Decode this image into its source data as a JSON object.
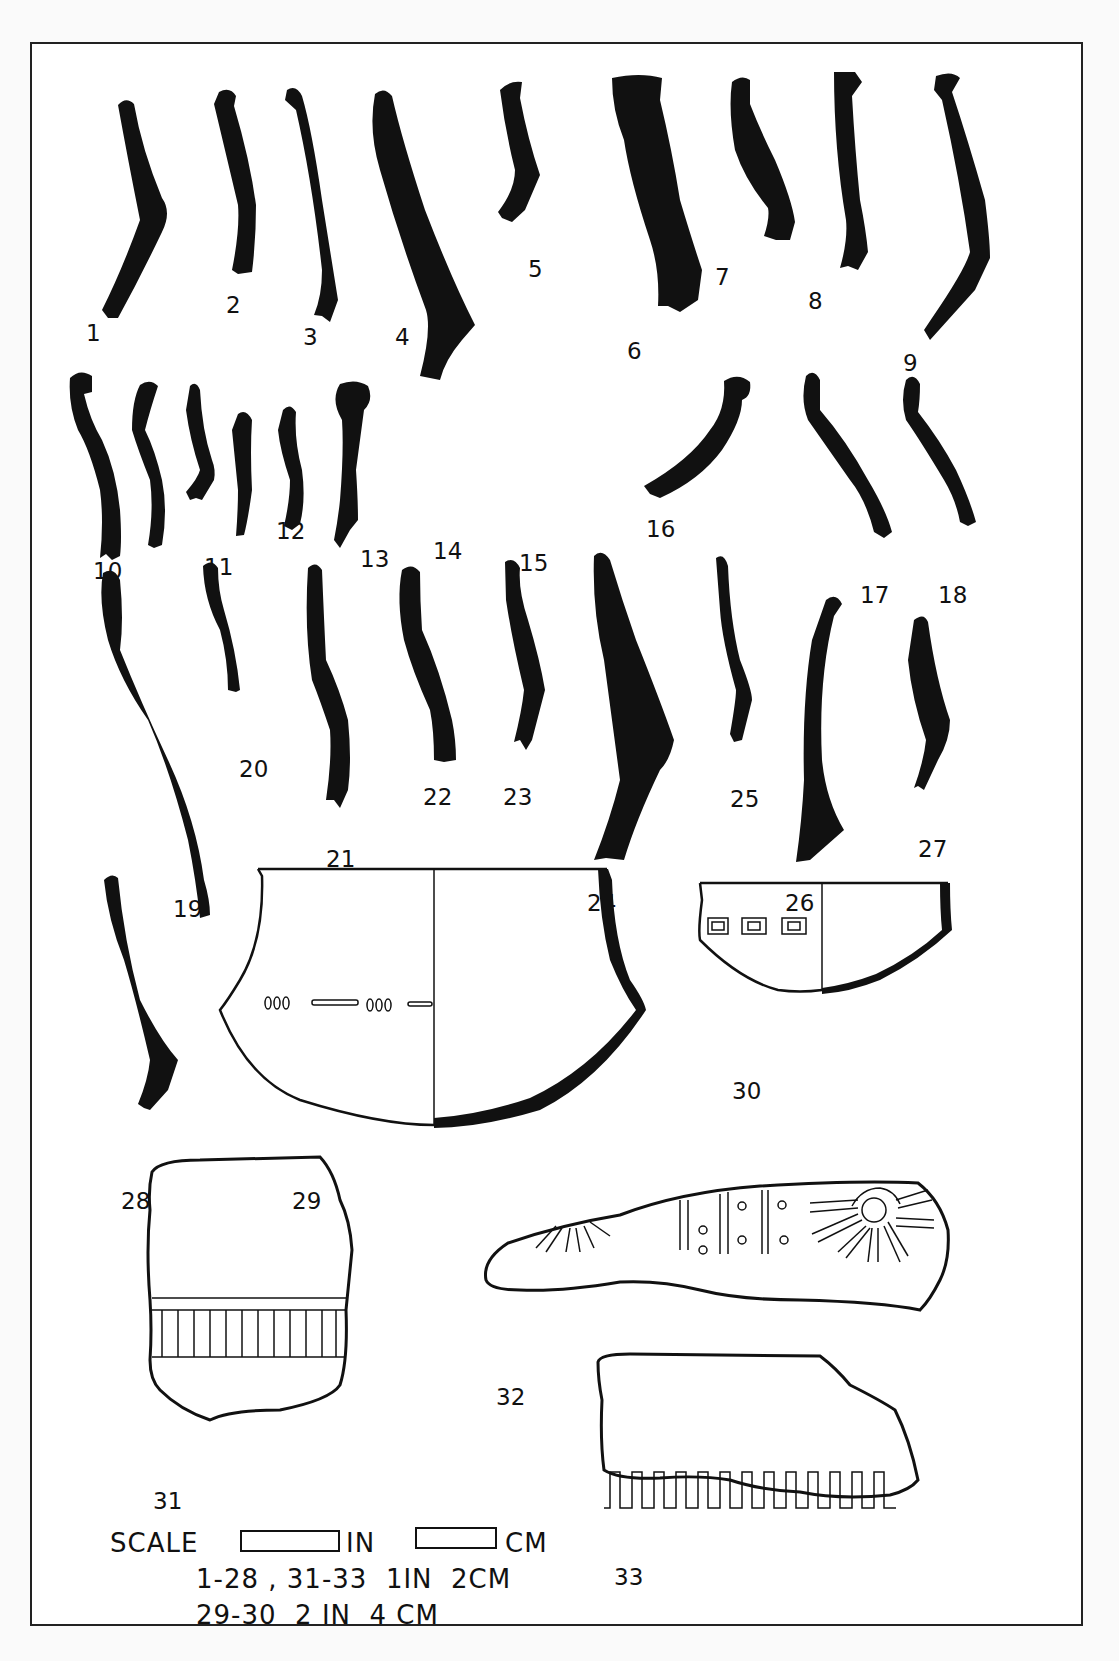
{
  "figure": {
    "type": "archaeological pottery plate"
  },
  "labels": [
    {
      "id": "1",
      "text": "1"
    },
    {
      "id": "2",
      "text": "2"
    },
    {
      "id": "3",
      "text": "3"
    },
    {
      "id": "4",
      "text": "4"
    },
    {
      "id": "5",
      "text": "5"
    },
    {
      "id": "6",
      "text": "6"
    },
    {
      "id": "7",
      "text": "7"
    },
    {
      "id": "8",
      "text": "8"
    },
    {
      "id": "9",
      "text": "9"
    },
    {
      "id": "10",
      "text": "10"
    },
    {
      "id": "11",
      "text": "11"
    },
    {
      "id": "12",
      "text": "12"
    },
    {
      "id": "13",
      "text": "13"
    },
    {
      "id": "14",
      "text": "14"
    },
    {
      "id": "15",
      "text": "15"
    },
    {
      "id": "16",
      "text": "16"
    },
    {
      "id": "17",
      "text": "17"
    },
    {
      "id": "18",
      "text": "18"
    },
    {
      "id": "19",
      "text": "19"
    },
    {
      "id": "20",
      "text": "20"
    },
    {
      "id": "21",
      "text": "21"
    },
    {
      "id": "22",
      "text": "22"
    },
    {
      "id": "23",
      "text": "23"
    },
    {
      "id": "24",
      "text": "24"
    },
    {
      "id": "25",
      "text": "25"
    },
    {
      "id": "26",
      "text": "26"
    },
    {
      "id": "27",
      "text": "27"
    },
    {
      "id": "28",
      "text": "28"
    },
    {
      "id": "29",
      "text": "29"
    },
    {
      "id": "30",
      "text": "30"
    },
    {
      "id": "31",
      "text": "31"
    },
    {
      "id": "32",
      "text": "32"
    },
    {
      "id": "33",
      "text": "33"
    }
  ],
  "scale": {
    "title": "SCALE",
    "unit_in": "IN",
    "unit_cm": "CM",
    "line1": "1-28 , 31-33  1IN  2CM",
    "line2": "29-30  2 IN  4 CM"
  },
  "colors": {
    "ink": "#111111",
    "paper": "#ffffff",
    "border": "#222222"
  }
}
